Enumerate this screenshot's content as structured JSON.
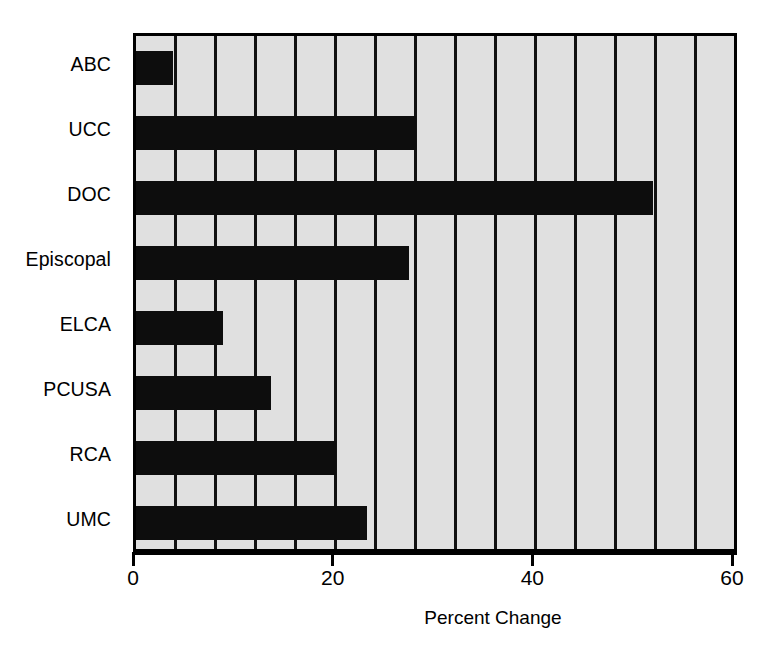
{
  "chart_data": {
    "type": "bar",
    "orientation": "horizontal",
    "title": "",
    "xlabel": "Percent Change",
    "ylabel": "",
    "categories": [
      "ABC",
      "UCC",
      "DOC",
      "Episcopal",
      "ELCA",
      "PCUSA",
      "RCA",
      "UMC"
    ],
    "values": [
      3.7,
      28.0,
      51.8,
      27.3,
      8.7,
      13.5,
      20.0,
      23.1
    ],
    "xlim": [
      0,
      60.5
    ],
    "xticks": [
      0,
      20,
      40,
      60
    ],
    "xticklabels": [
      "0",
      "20",
      "40",
      "60"
    ],
    "gridlines_x": [
      4,
      8,
      12,
      16,
      20,
      24,
      28,
      32,
      36,
      40,
      44,
      48,
      52,
      56,
      60
    ],
    "grid": true,
    "legend": "none",
    "colors": {
      "bar": "#0d0d0d",
      "plot_background": "#e0e0e0",
      "gridline": "#111111",
      "axis": "#000000",
      "figure_background": "#ffffff",
      "text": "#000000"
    }
  }
}
